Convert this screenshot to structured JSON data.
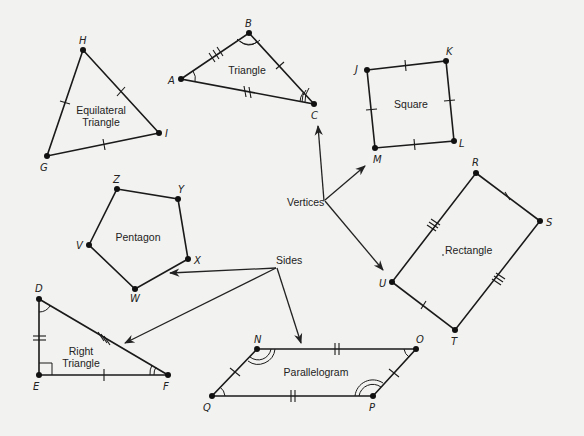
{
  "diagram": {
    "callouts": {
      "vertices": "Vertices",
      "sides": "Sides"
    },
    "shapes": [
      {
        "name": "Equilateral Triangle",
        "label_lines": [
          "Equilateral",
          "Triangle"
        ],
        "vertices": [
          {
            "id": "H",
            "x": 83,
            "y": 50
          },
          {
            "id": "I",
            "x": 159,
            "y": 133
          },
          {
            "id": "G",
            "x": 47,
            "y": 156
          }
        ],
        "side_ticks": {
          "HI": 1,
          "IG": 1,
          "GH": 1
        }
      },
      {
        "name": "Triangle",
        "label_lines": [
          "Triangle"
        ],
        "vertices": [
          {
            "id": "A",
            "x": 181,
            "y": 79
          },
          {
            "id": "B",
            "x": 249,
            "y": 33
          },
          {
            "id": "C",
            "x": 314,
            "y": 104
          }
        ],
        "side_ticks": {
          "AB": 3,
          "BC": 1,
          "AC": 2
        },
        "angle_arcs": {
          "A": 1,
          "B": 2,
          "C": 3
        }
      },
      {
        "name": "Square",
        "label_lines": [
          "Square"
        ],
        "vertices": [
          {
            "id": "J",
            "x": 367,
            "y": 70
          },
          {
            "id": "K",
            "x": 446,
            "y": 61
          },
          {
            "id": "L",
            "x": 454,
            "y": 141
          },
          {
            "id": "M",
            "x": 375,
            "y": 148
          }
        ],
        "side_ticks": {
          "JK": 1,
          "KL": 1,
          "LM": 1,
          "MJ": 1
        }
      },
      {
        "name": "Pentagon",
        "label_lines": [
          "Pentagon"
        ],
        "vertices": [
          {
            "id": "Z",
            "x": 117,
            "y": 189
          },
          {
            "id": "Y",
            "x": 178,
            "y": 199
          },
          {
            "id": "X",
            "x": 188,
            "y": 259
          },
          {
            "id": "W",
            "x": 135,
            "y": 289
          },
          {
            "id": "V",
            "x": 89,
            "y": 245
          }
        ]
      },
      {
        "name": "Rectangle",
        "label_lines": [
          "Rectangle"
        ],
        "vertices": [
          {
            "id": "R",
            "x": 476,
            "y": 173
          },
          {
            "id": "S",
            "x": 540,
            "y": 221
          },
          {
            "id": "T",
            "x": 455,
            "y": 330
          },
          {
            "id": "U",
            "x": 392,
            "y": 282
          }
        ],
        "side_ticks": {
          "RS": 1,
          "ST": 3,
          "TU": 1,
          "UR": 3
        }
      },
      {
        "name": "Right Triangle",
        "label_lines": [
          "Right",
          "Triangle"
        ],
        "vertices": [
          {
            "id": "D",
            "x": 39,
            "y": 299
          },
          {
            "id": "E",
            "x": 39,
            "y": 375
          },
          {
            "id": "F",
            "x": 168,
            "y": 375
          }
        ],
        "side_ticks": {
          "DE": 2,
          "EF": 1,
          "DF": 3
        },
        "angle_arcs": {
          "D": 1,
          "F": 2
        },
        "right_angle": "E"
      },
      {
        "name": "Parallelogram",
        "label_lines": [
          "Parallelogram"
        ],
        "vertices": [
          {
            "id": "N",
            "x": 257,
            "y": 349
          },
          {
            "id": "O",
            "x": 416,
            "y": 349
          },
          {
            "id": "P",
            "x": 373,
            "y": 396
          },
          {
            "id": "Q",
            "x": 212,
            "y": 396
          }
        ],
        "side_ticks": {
          "NO": 2,
          "OP": 1,
          "PQ": 2,
          "QN": 1
        },
        "angle_arcs": {
          "N": 2,
          "O": 1,
          "P": 2,
          "Q": 1
        }
      }
    ]
  },
  "colors": {
    "background": "#f2f2f0",
    "ink": "#1a1a1a"
  }
}
